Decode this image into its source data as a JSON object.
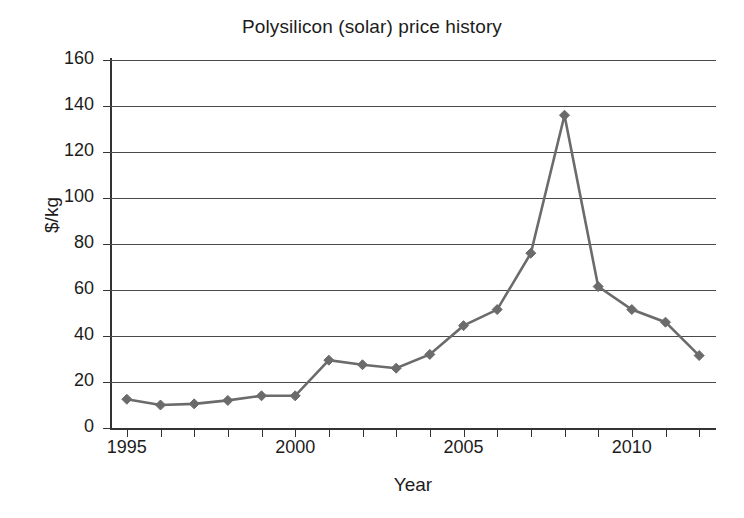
{
  "chart_data": {
    "type": "line",
    "title": "Polysilicon (solar) price history",
    "xlabel": "Year",
    "ylabel": "$/kg",
    "grid": true,
    "legend": "none",
    "marker": "diamond",
    "series_color": "#6b6b6b",
    "axis_color": "#333333",
    "xlim": [
      1994.5,
      2012.5
    ],
    "ylim": [
      0,
      160
    ],
    "ytick_labels": [
      "160",
      "140",
      "120",
      "100",
      "80",
      "60",
      "40",
      "20",
      "0"
    ],
    "ytick_values": [
      160,
      140,
      120,
      100,
      80,
      60,
      40,
      20,
      0
    ],
    "xtick_values": [
      1995,
      1996,
      1997,
      1998,
      1999,
      2000,
      2001,
      2002,
      2003,
      2004,
      2005,
      2006,
      2007,
      2008,
      2009,
      2010,
      2011,
      2012
    ],
    "xtick_labels_shown": [
      "1995",
      "2000",
      "2005",
      "2010"
    ],
    "xtick_labels_shown_values": [
      1995,
      2000,
      2005,
      2010
    ],
    "x": [
      1995,
      1996,
      1997,
      1998,
      1999,
      2000,
      2001,
      2002,
      2003,
      2004,
      2005,
      2006,
      2007,
      2008,
      2009,
      2010,
      2011,
      2012
    ],
    "values": [
      12.5,
      10,
      10.5,
      12,
      14,
      14,
      29.5,
      27.5,
      26,
      32,
      44.5,
      51.5,
      76,
      136,
      61.5,
      51.5,
      46,
      31.5
    ],
    "series": [
      {
        "name": "Polysilicon price",
        "values": [
          12.5,
          10,
          10.5,
          12,
          14,
          14,
          29.5,
          27.5,
          26,
          32,
          44.5,
          51.5,
          76,
          136,
          61.5,
          51.5,
          46,
          31.5
        ]
      }
    ]
  }
}
